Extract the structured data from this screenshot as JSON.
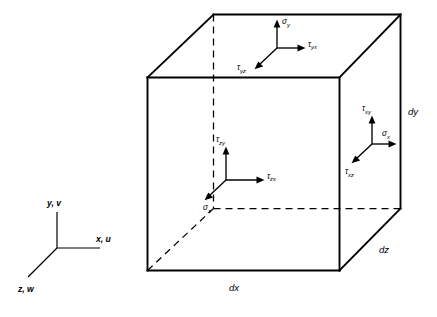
{
  "figure": {
    "background_color": "#ffffff",
    "line_color": "#000000"
  },
  "cube": {
    "dimensions": [
      {
        "name": "dx",
        "label": "dx",
        "position": "bottom-front-edge"
      },
      {
        "name": "dy",
        "label": "dy",
        "position": "right-back-vertical-edge"
      },
      {
        "name": "dz",
        "label": "dz",
        "position": "bottom-right-receding-edge"
      }
    ]
  },
  "stress_groups": {
    "top_face": {
      "face_name": "top-face-y-normal",
      "normal": "σy",
      "components": [
        {
          "name": "sigma-y",
          "symbol": "σ",
          "subscript": "y",
          "direction": "up",
          "type": "normal"
        },
        {
          "name": "tau-yx",
          "symbol": "τ",
          "subscript": "yx",
          "direction": "right",
          "type": "shear"
        },
        {
          "name": "tau-yz",
          "symbol": "τ",
          "subscript": "yz",
          "direction": "down-left",
          "type": "shear"
        }
      ]
    },
    "front_face": {
      "face_name": "front-face-z-normal",
      "normal": "σz",
      "components": [
        {
          "name": "tau-zy",
          "symbol": "τ",
          "subscript": "zy",
          "direction": "up",
          "type": "shear"
        },
        {
          "name": "tau-zx",
          "symbol": "τ",
          "subscript": "zx",
          "direction": "right",
          "type": "shear"
        },
        {
          "name": "sigma-z",
          "symbol": "σ",
          "subscript": "z",
          "direction": "down-left",
          "type": "normal"
        }
      ]
    },
    "right_face": {
      "face_name": "right-face-x-normal",
      "normal": "σx",
      "components": [
        {
          "name": "tau-xy",
          "symbol": "τ",
          "subscript": "xy",
          "direction": "up",
          "type": "shear"
        },
        {
          "name": "sigma-x",
          "symbol": "σ",
          "subscript": "x",
          "direction": "right",
          "type": "normal"
        },
        {
          "name": "tau-xz",
          "symbol": "τ",
          "subscript": "xz",
          "direction": "down-left",
          "type": "shear"
        }
      ]
    }
  },
  "axes_triad": {
    "name": "coordinate-axes-triad",
    "axes": [
      {
        "name": "y-axis",
        "label": "y, v",
        "direction": "up"
      },
      {
        "name": "x-axis",
        "label": "x, u",
        "direction": "right"
      },
      {
        "name": "z-axis",
        "label": "z, w",
        "direction": "down-left"
      }
    ]
  }
}
